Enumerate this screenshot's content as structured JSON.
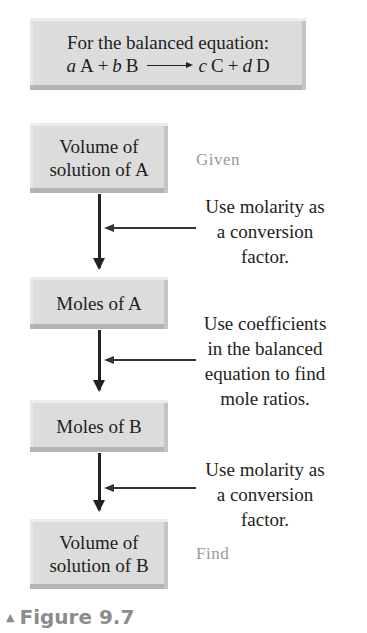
{
  "equation_box": {
    "line1": "For the balanced equation:",
    "coef_a": "a",
    "species_a": "A",
    "plus1": "+",
    "coef_b": "b",
    "species_b": "B",
    "coef_c": "c",
    "species_c": "C",
    "plus2": "+",
    "coef_d": "d",
    "species_d": "D"
  },
  "flow": {
    "boxes": [
      {
        "line1": "Volume of",
        "line2": "solution of A"
      },
      {
        "line1": "Moles of A"
      },
      {
        "line1": "Moles of B"
      },
      {
        "line1": "Volume of",
        "line2": "solution of B"
      }
    ],
    "notes": [
      {
        "lines": [
          "Use molarity as",
          "a conversion",
          "factor."
        ]
      },
      {
        "lines": [
          "Use coefficients",
          "in the balanced",
          "equation to find",
          "mole ratios."
        ]
      },
      {
        "lines": [
          "Use molarity as",
          "a conversion",
          "factor."
        ]
      }
    ],
    "given_label": "Given",
    "find_label": "Find"
  },
  "caption": {
    "marker": "▲",
    "text": "Figure 9.7"
  },
  "colors": {
    "box_fill": "#dcdcdc",
    "label_gray": "#9a9a9a",
    "caption_gray": "#8c8c8c"
  }
}
